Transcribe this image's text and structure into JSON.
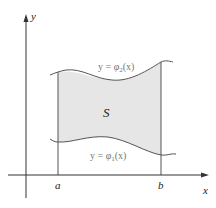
{
  "figure": {
    "region_label": "S",
    "upper_curve_label": {
      "prefix": "y = ",
      "func": "φ",
      "sub": "2",
      "suffix": "(x)"
    },
    "lower_curve_label": {
      "prefix": "y = ",
      "func": "φ",
      "sub": "1",
      "suffix": "(x)"
    },
    "axes": {
      "x_label": "x",
      "y_label": "y"
    },
    "bounds": {
      "a_label": "a",
      "b_label": "b"
    },
    "colors": {
      "fill": "#e6e6e6",
      "curve": "#555555",
      "axis": "#333333",
      "label": "#777777"
    }
  }
}
